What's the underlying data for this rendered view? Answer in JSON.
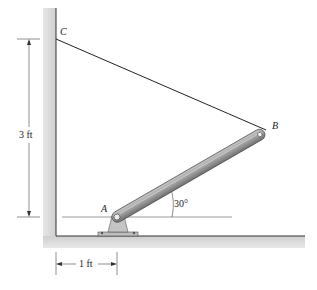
{
  "diagram": {
    "points": {
      "A": {
        "label": "A"
      },
      "B": {
        "label": "B"
      },
      "C": {
        "label": "C"
      }
    },
    "dimensions": {
      "vertical": "3 ft",
      "horizontal": "1 ft"
    },
    "angle": "30°",
    "colors": {
      "wall": "#d9d9d9",
      "rod": "#9a9a9a",
      "line": "#222222"
    }
  }
}
